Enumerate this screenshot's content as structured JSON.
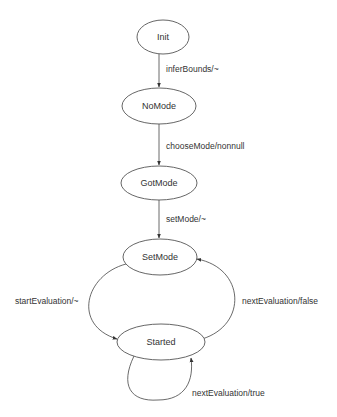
{
  "diagram": {
    "type": "state-machine",
    "colors": {
      "stroke": "#555555",
      "text": "#333333",
      "background": "#ffffff"
    },
    "states": [
      {
        "id": "init",
        "label": "Init",
        "cx": 163,
        "cy": 37,
        "rx": 26,
        "ry": 17
      },
      {
        "id": "nomode",
        "label": "NoMode",
        "cx": 159,
        "cy": 106,
        "rx": 37,
        "ry": 18
      },
      {
        "id": "gotmode",
        "label": "GotMode",
        "cx": 159,
        "cy": 183,
        "rx": 38,
        "ry": 17
      },
      {
        "id": "setmode",
        "label": "SetMode",
        "cx": 160,
        "cy": 257,
        "rx": 37,
        "ry": 18
      },
      {
        "id": "started",
        "label": "Started",
        "cx": 161,
        "cy": 342,
        "rx": 44,
        "ry": 18
      }
    ],
    "transitions": [
      {
        "from": "Init",
        "to": "NoMode",
        "label": "inferBounds/~"
      },
      {
        "from": "NoMode",
        "to": "GotMode",
        "label": "chooseMode/nonnull"
      },
      {
        "from": "GotMode",
        "to": "SetMode",
        "label": "setMode/~"
      },
      {
        "from": "SetMode",
        "to": "Started",
        "label": "startEvaluation/~"
      },
      {
        "from": "Started",
        "to": "SetMode",
        "label": "nextEvaluation/false"
      },
      {
        "from": "Started",
        "to": "Started",
        "label": "nextEvaluation/true"
      }
    ]
  }
}
